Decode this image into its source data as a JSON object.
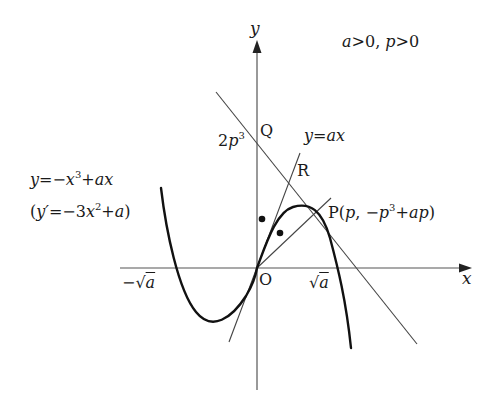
{
  "diagram": {
    "condition": "a>0, p>0",
    "axes": {
      "x_label": "x",
      "y_label": "y",
      "origin_label": "O",
      "x_ticks": [
        "-√a",
        "√a"
      ],
      "y_ticks": [
        "2p³"
      ]
    },
    "curve": {
      "equation": "y=-x³+ax",
      "derivative": "(y′=-3x²+a)"
    },
    "line": {
      "equation": "y=ax"
    },
    "points": {
      "P": "P(p, -p³+ap)",
      "Q": "Q",
      "R": "R"
    },
    "labels": {
      "y_axis": "y",
      "x_axis": "x",
      "origin": "O",
      "cond_a": "a",
      "cond_gt1": ">0, ",
      "cond_p": "p",
      "cond_gt2": ">0",
      "ytick_2": "2",
      "ytick_p": "p",
      "ytick_exp": "3",
      "q": "Q",
      "r": "R",
      "line_y": "y",
      "line_eq": "=",
      "line_ax": "ax",
      "curve_y": "y",
      "curve_eq": "=−",
      "curve_x": "x",
      "curve_exp": "3",
      "curve_plus": "+",
      "curve_ax": "ax",
      "deriv_open": "(",
      "deriv_y": "y′",
      "deriv_eq": "=−3",
      "deriv_x": "x",
      "deriv_exp": "2",
      "deriv_plus": "+",
      "deriv_a": "a",
      "deriv_close": ")",
      "p_name": "P(",
      "p_x": "p",
      "p_comma": ", −",
      "p_p": "p",
      "p_exp": "3",
      "p_plus": "+",
      "p_ap": "ap",
      "p_close": ")",
      "neg_sqrt": "−√",
      "neg_sqrt_a": "a",
      "pos_sqrt": "√",
      "pos_sqrt_a": "a"
    },
    "colors": {
      "axis": "#555555",
      "curve": "#111111",
      "line": "#444444",
      "text": "#1a1a1a"
    }
  }
}
